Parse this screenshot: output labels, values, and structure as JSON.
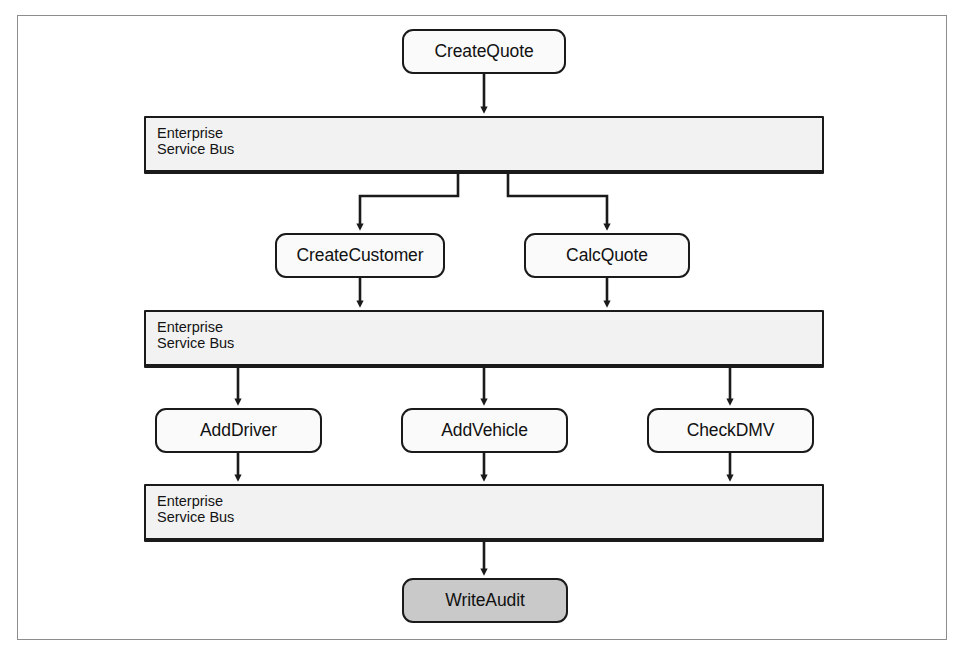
{
  "figure": {
    "frame_border_color": "#8d8d8d",
    "background": "#ffffff"
  },
  "style": {
    "node_fill": "#fafafa",
    "node_highlight_fill": "#c9c9c9",
    "bus_fill": "#f2f2f2",
    "stroke": "#1a1a1a",
    "text_color": "#111111"
  },
  "nodes": [
    {
      "id": "create-quote",
      "label": "CreateQuote",
      "x": 402,
      "y": 29,
      "w": 164,
      "h": 45,
      "highlight": false
    },
    {
      "id": "create-customer",
      "label": "CreateCustomer",
      "x": 275,
      "y": 233,
      "w": 170,
      "h": 45,
      "highlight": false
    },
    {
      "id": "calc-quote",
      "label": "CalcQuote",
      "x": 524,
      "y": 233,
      "w": 166,
      "h": 45,
      "highlight": false
    },
    {
      "id": "add-driver",
      "label": "AddDriver",
      "x": 155,
      "y": 408,
      "w": 167,
      "h": 45,
      "highlight": false
    },
    {
      "id": "add-vehicle",
      "label": "AddVehicle",
      "x": 401,
      "y": 408,
      "w": 167,
      "h": 45,
      "highlight": false
    },
    {
      "id": "check-dmv",
      "label": "CheckDMV",
      "x": 647,
      "y": 408,
      "w": 167,
      "h": 45,
      "highlight": false
    },
    {
      "id": "write-audit",
      "label": "WriteAudit",
      "x": 402,
      "y": 578,
      "w": 166,
      "h": 45,
      "highlight": true
    }
  ],
  "buses": [
    {
      "id": "esb-1",
      "line1": "Enterprise",
      "line2": "Service Bus",
      "x": 144,
      "y": 116,
      "w": 680,
      "h": 58
    },
    {
      "id": "esb-2",
      "line1": "Enterprise",
      "line2": "Service Bus",
      "x": 144,
      "y": 310,
      "w": 680,
      "h": 58
    },
    {
      "id": "esb-3",
      "line1": "Enterprise",
      "line2": "Service Bus",
      "x": 144,
      "y": 484,
      "w": 680,
      "h": 58
    }
  ],
  "connectors": [
    {
      "id": "create-quote-to-esb1",
      "from": "create-quote",
      "to": "esb-1",
      "kind": "straight"
    },
    {
      "id": "esb1-to-create-customer",
      "from": "esb-1",
      "to": "create-customer",
      "kind": "elbow-left"
    },
    {
      "id": "esb1-to-calc-quote",
      "from": "esb-1",
      "to": "calc-quote",
      "kind": "elbow-right"
    },
    {
      "id": "create-customer-to-esb2",
      "from": "create-customer",
      "to": "esb-2",
      "kind": "straight"
    },
    {
      "id": "calc-quote-to-esb2",
      "from": "calc-quote",
      "to": "esb-2",
      "kind": "straight"
    },
    {
      "id": "esb2-to-add-driver",
      "from": "esb-2",
      "to": "add-driver",
      "kind": "straight"
    },
    {
      "id": "esb2-to-add-vehicle",
      "from": "esb-2",
      "to": "add-vehicle",
      "kind": "straight"
    },
    {
      "id": "esb2-to-check-dmv",
      "from": "esb-2",
      "to": "check-dmv",
      "kind": "straight"
    },
    {
      "id": "add-driver-to-esb3",
      "from": "add-driver",
      "to": "esb-3",
      "kind": "straight"
    },
    {
      "id": "add-vehicle-to-esb3",
      "from": "add-vehicle",
      "to": "esb-3",
      "kind": "straight"
    },
    {
      "id": "check-dmv-to-esb3",
      "from": "check-dmv",
      "to": "esb-3",
      "kind": "straight"
    },
    {
      "id": "esb3-to-write-audit",
      "from": "esb-3",
      "to": "write-audit",
      "kind": "straight"
    }
  ]
}
